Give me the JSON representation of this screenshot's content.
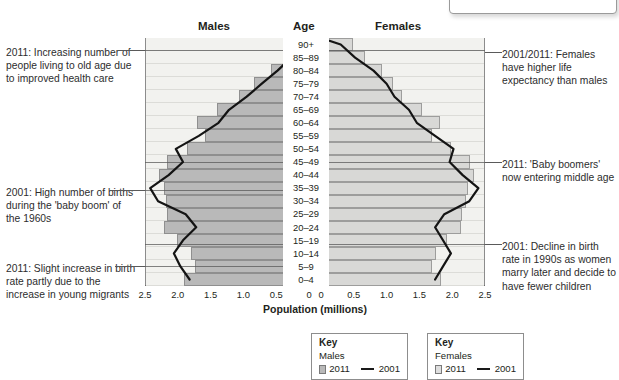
{
  "top_callout": {
    "text": "by sex and age."
  },
  "headers": {
    "males": "Males",
    "age": "Age",
    "females": "Females"
  },
  "axis": {
    "title": "Population (millions)",
    "male_ticks": [
      "2.5",
      "2.0",
      "1.5",
      "1.0",
      "0.5",
      "0"
    ],
    "female_ticks": [
      "0",
      "0.5",
      "1.0",
      "1.5",
      "2.0",
      "2.5"
    ]
  },
  "keys": {
    "males": {
      "title": "Key",
      "subtitle": "Males",
      "bar_label": "2011",
      "line_label": "2001"
    },
    "females": {
      "title": "Key",
      "subtitle": "Females",
      "bar_label": "2011",
      "line_label": "2001"
    }
  },
  "annotations": {
    "left": [
      {
        "name": "annotation-old-age",
        "text": "2011: Increasing number of people living to old age due to improved health care",
        "top": 46,
        "leader_y": 50,
        "leader_x": 118,
        "leader_w": 27
      },
      {
        "name": "annotation-baby-boom",
        "text": "2001: High number of births during the 'baby boom' of the 1960s",
        "top": 186,
        "leader_y": 190,
        "leader_x": 110,
        "leader_w": 35
      },
      {
        "name": "annotation-birth-rate-up",
        "text": "2011: Slight increase in birth rate partly due to the increase in young migrants",
        "top": 262,
        "leader_y": 266,
        "leader_x": 115,
        "leader_w": 30
      }
    ],
    "right": [
      {
        "name": "annotation-life-expectancy",
        "text": "2001/2011: Females have higher life expectancy than males",
        "top": 48,
        "leader_y": 52,
        "leader_x": 485,
        "leader_w": 17
      },
      {
        "name": "annotation-boomers-middle",
        "text": "2011: 'Baby boomers' now entering middle age",
        "top": 158,
        "leader_y": 162,
        "leader_x": 485,
        "leader_w": 17
      },
      {
        "name": "annotation-birth-decline",
        "text": "2001: Decline in birth rate in 1990s as women marry later and decide to have fewer children",
        "top": 240,
        "leader_y": 244,
        "leader_x": 485,
        "leader_w": 17
      }
    ]
  },
  "chart_data": {
    "type": "bar",
    "subtype": "population-pyramid",
    "xlabel": "Population (millions)",
    "ylabel": "Age",
    "xlim": [
      0,
      2.5
    ],
    "grid": true,
    "legend_position": "bottom",
    "categories": [
      "90+",
      "85–89",
      "80–84",
      "75–79",
      "70–74",
      "65–69",
      "60–64",
      "55–59",
      "50–54",
      "45–49",
      "40–44",
      "35–39",
      "30–34",
      "25–29",
      "20–24",
      "15–19",
      "10–14",
      "5–9",
      "0–4"
    ],
    "series": [
      {
        "name": "Males 2011",
        "sex": "male",
        "year": 2011,
        "kind": "bar",
        "color": "#b9b9b9",
        "values": [
          0.2,
          0.38,
          0.6,
          0.85,
          1.08,
          1.42,
          1.72,
          1.6,
          1.88,
          2.18,
          2.3,
          2.22,
          2.2,
          2.18,
          2.22,
          2.02,
          1.82,
          1.76,
          1.92
        ]
      },
      {
        "name": "Males 2001",
        "sex": "male",
        "year": 2001,
        "kind": "line",
        "color": "#1a1a1a",
        "values": [
          0.12,
          0.27,
          0.48,
          0.72,
          0.95,
          1.22,
          1.38,
          1.68,
          2.03,
          1.92,
          2.14,
          2.42,
          2.3,
          1.88,
          1.72,
          1.92,
          2.06,
          1.96,
          1.82
        ]
      },
      {
        "name": "Females 2011",
        "sex": "female",
        "year": 2011,
        "kind": "bar",
        "color": "#d8d8d6",
        "values": [
          0.48,
          0.66,
          0.92,
          1.08,
          1.22,
          1.52,
          1.8,
          1.68,
          1.96,
          2.25,
          2.32,
          2.22,
          2.2,
          2.14,
          2.12,
          1.9,
          1.74,
          1.68,
          1.82
        ]
      },
      {
        "name": "Females 2001",
        "sex": "female",
        "year": 2001,
        "kind": "line",
        "color": "#1a1a1a",
        "values": [
          0.3,
          0.52,
          0.8,
          1.0,
          1.12,
          1.34,
          1.46,
          1.74,
          2.02,
          1.96,
          2.16,
          2.4,
          2.26,
          1.88,
          1.74,
          1.86,
          1.98,
          1.86,
          1.74
        ]
      }
    ]
  }
}
